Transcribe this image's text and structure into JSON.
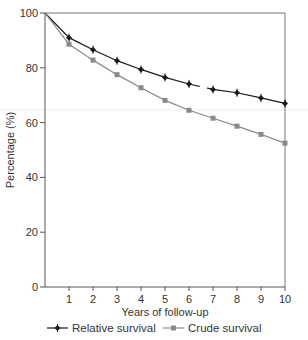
{
  "chart_data": {
    "type": "line",
    "title": "",
    "xlabel": "Years of follow-up",
    "ylabel": "Percentage (%)",
    "x": [
      0,
      1,
      2,
      3,
      4,
      5,
      6,
      7,
      8,
      9,
      10
    ],
    "xticks": [
      "1",
      "2",
      "3",
      "4",
      "5",
      "6",
      "7",
      "8",
      "9",
      "10"
    ],
    "yticks": [
      "0",
      "20",
      "40",
      "60",
      "80",
      "100"
    ],
    "xlim": [
      0,
      10
    ],
    "ylim": [
      0,
      100
    ],
    "grid": false,
    "legend_position": "bottom",
    "series": [
      {
        "name": "Relative survival",
        "color": "#1a1a1a",
        "marker": "diamond",
        "values": [
          100,
          91.0,
          86.6,
          82.6,
          79.4,
          76.5,
          74.1,
          72.1,
          70.9,
          69.0,
          67.0
        ]
      },
      {
        "name": "Crude survival",
        "color": "#8a8a8a",
        "marker": "square",
        "values": [
          100,
          88.6,
          82.8,
          77.5,
          72.7,
          68.1,
          64.5,
          61.6,
          58.7,
          55.7,
          52.5
        ]
      }
    ]
  }
}
